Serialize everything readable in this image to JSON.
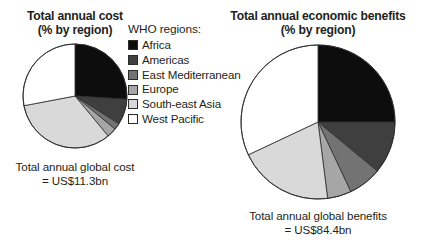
{
  "legend": {
    "title": "WHO regions:",
    "items": [
      {
        "label": "Africa",
        "color": "#0d0d0d"
      },
      {
        "label": "Americas",
        "color": "#3f3f3f"
      },
      {
        "label": "East Mediterranean",
        "color": "#737373"
      },
      {
        "label": "Europe",
        "color": "#a6a6a6"
      },
      {
        "label": "South-east Asia",
        "color": "#d9d9d9"
      },
      {
        "label": "West Pacific",
        "color": "#ffffff"
      }
    ]
  },
  "charts": [
    {
      "id": "cost",
      "title_line1": "Total annual cost",
      "title_line2": "(% by region)",
      "caption_line1": "Total annual global cost",
      "caption_line2": "= US$11.3bn",
      "radius": 52,
      "chart_data": {
        "type": "pie",
        "title": "Total annual cost (% by region)",
        "unit": "percent",
        "start_angle_deg": 0,
        "direction": "clockwise",
        "labels": [
          "Africa",
          "Americas",
          "East Mediterranean",
          "Europe",
          "South-east Asia",
          "West Pacific"
        ],
        "values": [
          26,
          8,
          2,
          3,
          33,
          28
        ],
        "colors": [
          "#0d0d0d",
          "#3f3f3f",
          "#737373",
          "#a6a6a6",
          "#d9d9d9",
          "#ffffff"
        ],
        "annotation": "Total annual global cost = US$11.3bn",
        "total_label": "US$11.3bn",
        "legend_position": "center"
      }
    },
    {
      "id": "benefits",
      "title_line1": "Total annual economic benefits",
      "title_line2": "(% by region)",
      "caption_line1": "Total annual global benefits",
      "caption_line2": "= US$84.4bn",
      "radius": 77,
      "chart_data": {
        "type": "pie",
        "title": "Total annual economic benefits (% by region)",
        "unit": "percent",
        "start_angle_deg": 0,
        "direction": "clockwise",
        "labels": [
          "Africa",
          "Americas",
          "East Mediterranean",
          "Europe",
          "South-east Asia",
          "West Pacific"
        ],
        "values": [
          25,
          11,
          7,
          5,
          20,
          32
        ],
        "colors": [
          "#0d0d0d",
          "#3f3f3f",
          "#737373",
          "#a6a6a6",
          "#d9d9d9",
          "#ffffff"
        ],
        "annotation": "Total annual global benefits = US$84.4bn",
        "total_label": "US$84.4bn",
        "legend_position": "center"
      }
    }
  ]
}
